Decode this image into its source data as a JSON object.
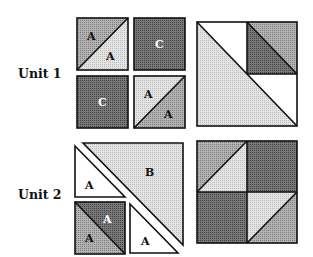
{
  "figure": {
    "units": [
      {
        "label": "Unit 1",
        "pieces": {
          "hst_top_left": {
            "upper": "A",
            "lower": "A"
          },
          "solid_top_right": "C",
          "solid_bottom_left": "C",
          "hst_bottom_right": {
            "upper": "A",
            "lower": "A"
          }
        }
      },
      {
        "label": "Unit 2",
        "pieces": {
          "large_triangle": "B",
          "white_triangle_top": "A",
          "hst_bottom": {
            "upper": "A",
            "lower": "A"
          },
          "white_triangle_bottom": "A"
        }
      }
    ],
    "colors": {
      "light": "#d6d6d6",
      "medium": "#9a9a9a",
      "dark": "#5e5e5e",
      "white": "#ffffff",
      "outline": "#111111"
    }
  }
}
